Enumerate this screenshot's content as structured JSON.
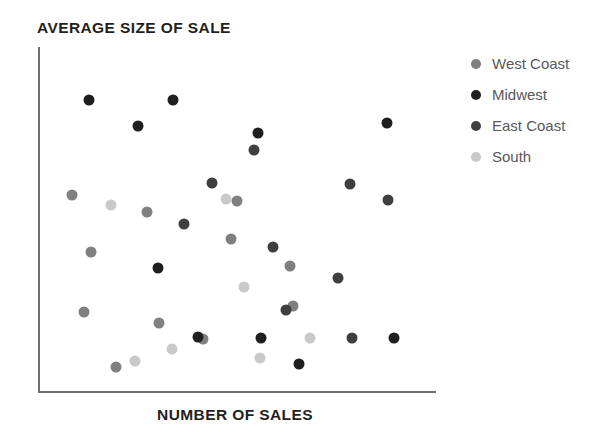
{
  "chart_data": {
    "type": "scatter",
    "title": "AVERAGE SIZE OF SALE",
    "xlabel": "NUMBER OF SALES",
    "ylabel": "AVERAGE SIZE OF SALE",
    "grid": false,
    "axes": {
      "ticks_shown": false,
      "tick_labels": [],
      "xlim": [
        0,
        100
      ],
      "ylim": [
        0,
        100
      ]
    },
    "legend": {
      "position": "right",
      "entries": [
        {
          "name": "West Coast",
          "color": "#808080"
        },
        {
          "name": "Midwest",
          "color": "#1f1f1f"
        },
        {
          "name": "East Coast",
          "color": "#3f3f3f"
        },
        {
          "name": "South",
          "color": "#c9c9c9"
        }
      ]
    },
    "series": [
      {
        "name": "West Coast",
        "color": "#808080",
        "points": [
          {
            "x": 8.5,
            "y": 57.2
          },
          {
            "x": 27.4,
            "y": 52.3
          },
          {
            "x": 13.3,
            "y": 40.8
          },
          {
            "x": 11.6,
            "y": 23.4
          },
          {
            "x": 30.4,
            "y": 20.2
          },
          {
            "x": 19.6,
            "y": 7.5
          },
          {
            "x": 41.5,
            "y": 15.6
          },
          {
            "x": 64.1,
            "y": 25.1
          },
          {
            "x": 63.3,
            "y": 36.7
          },
          {
            "x": 48.5,
            "y": 44.5
          },
          {
            "x": 50.0,
            "y": 55.5
          }
        ]
      },
      {
        "name": "Midwest",
        "color": "#1f1f1f",
        "points": [
          {
            "x": 12.8,
            "y": 84.7
          },
          {
            "x": 33.9,
            "y": 84.7
          },
          {
            "x": 55.3,
            "y": 75.1
          },
          {
            "x": 87.7,
            "y": 78.0
          },
          {
            "x": 25.1,
            "y": 77.2
          },
          {
            "x": 30.2,
            "y": 36.1
          },
          {
            "x": 40.2,
            "y": 16.2
          },
          {
            "x": 56.0,
            "y": 15.9
          },
          {
            "x": 89.4,
            "y": 15.9
          },
          {
            "x": 65.6,
            "y": 8.4
          }
        ]
      },
      {
        "name": "East Coast",
        "color": "#3f3f3f",
        "points": [
          {
            "x": 43.7,
            "y": 60.7
          },
          {
            "x": 36.8,
            "y": 48.8
          },
          {
            "x": 59.1,
            "y": 42.2
          },
          {
            "x": 78.4,
            "y": 60.4
          },
          {
            "x": 87.9,
            "y": 55.8
          },
          {
            "x": 75.4,
            "y": 33.2
          },
          {
            "x": 78.9,
            "y": 15.9
          },
          {
            "x": 54.3,
            "y": 70.2
          },
          {
            "x": 62.2,
            "y": 24.0
          }
        ]
      },
      {
        "name": "South",
        "color": "#c9c9c9",
        "points": [
          {
            "x": 18.3,
            "y": 54.3
          },
          {
            "x": 47.2,
            "y": 56.1
          },
          {
            "x": 51.8,
            "y": 30.6
          },
          {
            "x": 33.7,
            "y": 12.7
          },
          {
            "x": 24.4,
            "y": 9.2
          },
          {
            "x": 55.8,
            "y": 10.1
          },
          {
            "x": 68.3,
            "y": 15.9
          }
        ]
      }
    ]
  }
}
